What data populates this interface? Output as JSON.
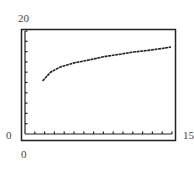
{
  "chart_data": {
    "type": "line",
    "title": "",
    "xlabel": "",
    "ylabel": "",
    "xlim": [
      0,
      15
    ],
    "ylim": [
      0,
      20
    ],
    "grid": false,
    "legend": null,
    "x_ticks_count": 15,
    "y_ticks_count": 10,
    "labels": {
      "y_max": "20",
      "y_min": "0",
      "x_max": "15",
      "x_min": "0"
    },
    "series": [
      {
        "name": "f(x)",
        "x": [
          1.8,
          2.6,
          3.6,
          5.0,
          6.6,
          8.0,
          9.7,
          11.0,
          12.8,
          14.0,
          14.9
        ],
        "values": [
          10.3,
          12.0,
          13.0,
          13.8,
          14.4,
          15.0,
          15.5,
          15.9,
          16.3,
          16.6,
          16.9
        ]
      }
    ]
  },
  "colors": {
    "axis": "#222222",
    "curve": "#222222",
    "background": "#ffffff"
  }
}
